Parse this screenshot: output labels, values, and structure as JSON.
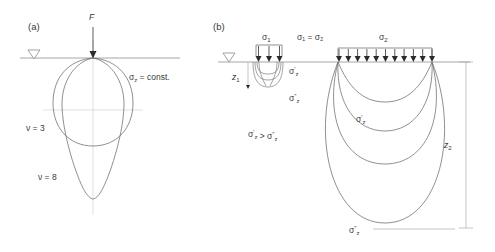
{
  "figure": {
    "panels": [
      {
        "id": "a",
        "label": "(a)",
        "load_label": "F",
        "ground_symbol": "water-table-triangle",
        "annotations": [
          {
            "key": "stress_const",
            "base": "σ",
            "sub": "z",
            "rest": " = const."
          },
          {
            "key": "nu3",
            "text": "ν = 3"
          },
          {
            "key": "nu8",
            "text": "ν = 8"
          }
        ],
        "curves": [
          {
            "name": "bulb-nu-3",
            "description": "near-circular pressure bulb for concentration factor nu = 3"
          },
          {
            "name": "bulb-nu-8",
            "description": "elongated teardrop pressure bulb for concentration factor nu = 8"
          }
        ]
      },
      {
        "id": "b",
        "label": "(b)",
        "ground_symbol": "water-table-triangle",
        "loads": [
          {
            "name": "small-load",
            "label_base": "σ",
            "label_sub": "1",
            "arrow_count": 3
          },
          {
            "name": "large-load",
            "label_base": "σ",
            "label_sub": "2",
            "arrow_count": 11
          }
        ],
        "annotations": [
          {
            "key": "equal_stress",
            "text": "σ₁ = σ₂"
          },
          {
            "key": "depth_z1",
            "base": "z",
            "sub": "1"
          },
          {
            "key": "depth_z2",
            "base": "z",
            "sub": "2"
          },
          {
            "key": "sigma_prime_small",
            "base": "σ",
            "prime": "′",
            "sub": "z"
          },
          {
            "key": "sigma_dprime_small",
            "base": "σ",
            "prime": "″",
            "sub": "z"
          },
          {
            "key": "sigma_prime_large",
            "base": "σ",
            "prime": "′",
            "sub": "z"
          },
          {
            "key": "sigma_dprime_large",
            "base": "σ",
            "prime": "″",
            "sub": "z"
          },
          {
            "key": "inequality",
            "text": "σ′z > σ″z"
          }
        ],
        "curves": [
          {
            "name": "small-bulb-1",
            "description": "shallow pressure bulb under narrow load"
          },
          {
            "name": "small-bulb-2",
            "description": "second shallow pressure bulb under narrow load"
          },
          {
            "name": "small-bulb-3",
            "description": "deepest shallow pressure bulb under narrow load"
          },
          {
            "name": "large-bulb-1",
            "description": "shallowest pressure bulb under wide load"
          },
          {
            "name": "large-bulb-2",
            "description": "second pressure bulb under wide load"
          },
          {
            "name": "large-bulb-3",
            "description": "third pressure bulb under wide load"
          },
          {
            "name": "large-bulb-4",
            "description": "deepest pressure bulb under wide load reaching depth z2"
          }
        ]
      }
    ],
    "colors": {
      "curve": "#6b6b6b",
      "ground": "#8f8f8f",
      "arrow": "#2b2b2b",
      "text": "#3a3a3a",
      "axis": "#c9c9c9"
    }
  }
}
